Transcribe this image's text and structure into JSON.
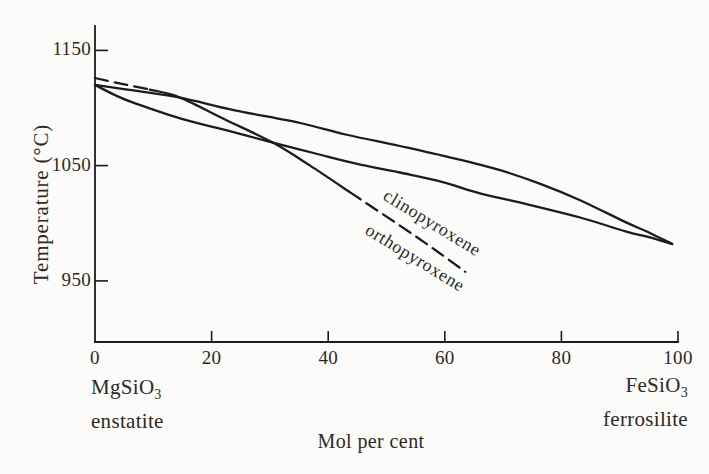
{
  "figure": {
    "background_color": "#fbfbf9",
    "line_color": "#1c1c1c",
    "text_color": "#2c2a27"
  },
  "chart_data": {
    "type": "line",
    "title": "",
    "xlabel": "Mol per cent",
    "ylabel": "Temperature (°C)",
    "xlim": [
      0,
      100
    ],
    "ylim": [
      897,
      1172
    ],
    "x_ticks": [
      0,
      20,
      40,
      60,
      80,
      100
    ],
    "y_ticks": [
      1150,
      1050,
      950
    ],
    "grid": false,
    "legend_position": "none",
    "end_members": {
      "left": {
        "formula_base": "MgSiO",
        "formula_sub": "3",
        "name": "enstatite"
      },
      "right": {
        "formula_base": "FeSiO",
        "formula_sub": "3",
        "name": "ferrosilite"
      }
    },
    "series": [
      {
        "name": "two-phase-loop-upper",
        "style": "solid",
        "points": [
          [
            0,
            1120
          ],
          [
            6.9,
            1115
          ],
          [
            14.6,
            1109
          ],
          [
            24,
            1098
          ],
          [
            35.2,
            1087
          ],
          [
            43,
            1077
          ],
          [
            52.3,
            1067
          ],
          [
            61,
            1057
          ],
          [
            69.5,
            1046
          ],
          [
            76.5,
            1034
          ],
          [
            83.2,
            1020
          ],
          [
            91,
            1001
          ],
          [
            95,
            992
          ],
          [
            99,
            982
          ]
        ]
      },
      {
        "name": "two-phase-loop-lower",
        "style": "solid",
        "points": [
          [
            0,
            1120
          ],
          [
            3.5,
            1111
          ],
          [
            6.9,
            1104
          ],
          [
            14.6,
            1091
          ],
          [
            22.3,
            1081
          ],
          [
            30.5,
            1070
          ],
          [
            37.5,
            1061
          ],
          [
            44.6,
            1052
          ],
          [
            52.3,
            1044
          ],
          [
            59.5,
            1036
          ],
          [
            66,
            1026
          ],
          [
            74.5,
            1016
          ],
          [
            83.2,
            1005
          ],
          [
            91,
            993
          ],
          [
            95,
            988
          ],
          [
            99,
            982
          ]
        ]
      },
      {
        "name": "cpx-opx-boundary-dashed-left",
        "style": "dashed",
        "points": [
          [
            0,
            1126
          ],
          [
            4.6,
            1121
          ],
          [
            9.4,
            1116
          ]
        ]
      },
      {
        "name": "cpx-opx-boundary-solid",
        "style": "solid",
        "points": [
          [
            9.4,
            1116
          ],
          [
            14.6,
            1109
          ],
          [
            22.3,
            1090
          ],
          [
            30.5,
            1070
          ],
          [
            36.9,
            1050
          ],
          [
            43.7,
            1027
          ]
        ]
      },
      {
        "name": "cpx-opx-boundary-dashed-right",
        "style": "dashed",
        "points": [
          [
            43.7,
            1027
          ],
          [
            52.3,
            998
          ],
          [
            58.3,
            977
          ],
          [
            63.5,
            958
          ]
        ]
      }
    ],
    "annotations": [
      {
        "text": "clinopyroxene",
        "x": 57.8,
        "y": 1000,
        "angle": 31.5
      },
      {
        "text": "orthopyroxene",
        "x": 54.9,
        "y": 970,
        "angle": 31.5
      }
    ]
  }
}
